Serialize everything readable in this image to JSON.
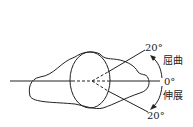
{
  "diagram": {
    "title": "",
    "labels": {
      "flexion_angle": "20°",
      "flexion": "屈曲",
      "neutral": "0°",
      "extension": "伸展",
      "extension_angle": "20°"
    },
    "colors": {
      "stroke": "#222222",
      "background": "#ffffff"
    }
  }
}
